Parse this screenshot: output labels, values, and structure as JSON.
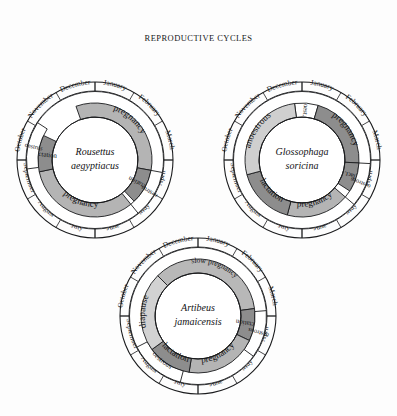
{
  "title": "REPRODUCTIVE CYCLES",
  "colors": {
    "background": "#fdfdfd",
    "ink": "#141518",
    "pregnancy": "#b4b4b4",
    "slow_pregnancy": "#b8b8b8",
    "lactation": "#8d8d8d",
    "oestrus": "#ffffff",
    "anoestrous": "#cfcfcf",
    "diapause": "#d2d2d2",
    "ring_outline": "#1a1b1d"
  },
  "months": [
    "January",
    "February",
    "March",
    "April",
    "May",
    "June",
    "July",
    "August",
    "September",
    "October",
    "November",
    "December"
  ],
  "chart_data": {
    "type": "pie",
    "title": "REPRODUCTIVE CYCLES",
    "note": "Three annual reproductive cycle wheels; each wheel spans 12 months clockwise starting at January at top.",
    "legend_position": "none",
    "grid": false,
    "charts": [
      {
        "id": "rousettus",
        "name_line1": "Rousettus",
        "name_line2": "aegyptiacus",
        "cx": 95,
        "cy": 160,
        "r": 78,
        "segments": [
          {
            "label": "pregnancy",
            "start_month": 11.35,
            "end_month": 3.35,
            "fill": "pregnancy",
            "band": "inner",
            "label_mode": "arc"
          },
          {
            "label": "lactation",
            "start_month": 3.35,
            "end_month": 4.55,
            "fill": "lactation",
            "band": "inner",
            "label_mode": "radial"
          },
          {
            "label": "oestrus",
            "start_month": 3.35,
            "end_month": 4.7,
            "fill": "oestrus",
            "band": "outer",
            "label_mode": "radial"
          },
          {
            "label": "pregnancy",
            "start_month": 4.7,
            "end_month": 8.6,
            "fill": "pregnancy",
            "band": "inner",
            "label_mode": "arc"
          },
          {
            "label": "lactation",
            "start_month": 8.6,
            "end_month": 9.85,
            "fill": "lactation",
            "band": "inner",
            "label_mode": "radial"
          },
          {
            "label": "oestrus",
            "start_month": 8.75,
            "end_month": 10.1,
            "fill": "oestrus",
            "band": "outer",
            "label_mode": "radial"
          }
        ]
      },
      {
        "id": "glossophaga",
        "name_line1": "Glossophaga",
        "name_line2": "soricina",
        "cx": 302,
        "cy": 160,
        "r": 78,
        "segments": [
          {
            "label": "oest.",
            "start_month": 11.75,
            "end_month": 0.55,
            "fill": "oestrus",
            "band": "inner",
            "label_mode": "arc"
          },
          {
            "label": "pregnancy",
            "start_month": 0.55,
            "end_month": 3.1,
            "fill": "lactation",
            "band": "inner",
            "label_mode": "arc"
          },
          {
            "label": "lact.",
            "start_month": 3.1,
            "end_month": 4.1,
            "fill": "lactation",
            "band": "inner",
            "label_mode": "radial"
          },
          {
            "label": "oestrous",
            "start_month": 3.1,
            "end_month": 4.35,
            "fill": "oestrus",
            "band": "outer",
            "label_mode": "radial"
          },
          {
            "label": "pregnancy",
            "start_month": 4.35,
            "end_month": 6.5,
            "fill": "pregnancy",
            "band": "inner",
            "label_mode": "arc"
          },
          {
            "label": "lactation",
            "start_month": 6.5,
            "end_month": 8.5,
            "fill": "lactation",
            "band": "inner",
            "label_mode": "arc"
          },
          {
            "label": "anoestrous",
            "start_month": 8.5,
            "end_month": 11.75,
            "fill": "anoestrous",
            "band": "inner",
            "label_mode": "arc"
          }
        ]
      },
      {
        "id": "artibeus",
        "name_line1": "Artibeus",
        "name_line2": "jamaicensis",
        "cx": 198,
        "cy": 316,
        "r": 78,
        "segments": [
          {
            "label": "slow pregnancy",
            "start_month": 10.5,
            "end_month": 2.75,
            "fill": "slow_pregnancy",
            "band": "inner",
            "label_mode": "arc"
          },
          {
            "label": "lactation",
            "start_month": 2.75,
            "end_month": 3.85,
            "fill": "lactation",
            "band": "inner",
            "label_mode": "radial"
          },
          {
            "label": "oestrous",
            "start_month": 2.85,
            "end_month": 4.2,
            "fill": "oestrus",
            "band": "outer",
            "label_mode": "radial"
          },
          {
            "label": "pregnancy",
            "start_month": 3.85,
            "end_month": 6.3,
            "fill": "pregnancy",
            "band": "inner",
            "label_mode": "arc"
          },
          {
            "label": "lactation",
            "start_month": 6.3,
            "end_month": 7.8,
            "fill": "lactation",
            "band": "inner",
            "label_mode": "arc"
          },
          {
            "label": "oestrous",
            "start_month": 6.5,
            "end_month": 8.1,
            "fill": "oestrus",
            "band": "outer",
            "label_mode": "arc"
          },
          {
            "label": "diapause",
            "start_month": 7.8,
            "end_month": 10.5,
            "fill": "diapause",
            "band": "inner",
            "label_mode": "arc"
          }
        ]
      }
    ]
  }
}
